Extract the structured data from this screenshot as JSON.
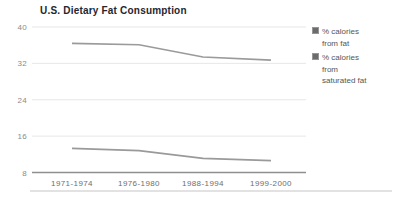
{
  "chart_data": {
    "type": "line",
    "title": "U.S. Dietary Fat Consumption",
    "categories": [
      "1971-1974",
      "1976-1980",
      "1988-1994",
      "1999-2000"
    ],
    "series": [
      {
        "name": "% calories from fat",
        "label_lines": [
          "% calories",
          "from fat"
        ],
        "values": [
          36.4,
          36.1,
          33.4,
          32.7
        ],
        "color": "#9a9a9a"
      },
      {
        "name": "% calories from saturated fat",
        "label_lines": [
          "% calories",
          "from",
          "saturated fat"
        ],
        "values": [
          13.3,
          12.8,
          11.1,
          10.6
        ],
        "color": "#9a9a9a"
      }
    ],
    "ylim": [
      8,
      40
    ],
    "yticks": [
      8,
      16,
      24,
      32,
      40
    ],
    "grid": "horizontal",
    "legend_position": "right",
    "style": {
      "background": "#ffffff",
      "title_color": "#26262e",
      "gridline_color": "#e7e7e7",
      "axis_color": "#8f8f8f",
      "ytick_label_color": "#8a8a8a",
      "xtick_label_color": "#6e6e6e",
      "legend_text_color": "#555555",
      "legend_swatch_color": "#6b6b6b"
    }
  }
}
